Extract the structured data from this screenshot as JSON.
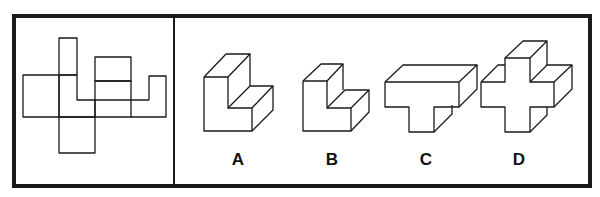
{
  "puzzle": {
    "net_panel": {
      "description": "unfolded net of a 3D shape"
    },
    "options": [
      {
        "label": "A",
        "shape": "L-shaped block (tall)"
      },
      {
        "label": "B",
        "shape": "L-shaped block (short)"
      },
      {
        "label": "C",
        "shape": "T-shaped block"
      },
      {
        "label": "D",
        "shape": "plus-shaped block"
      }
    ]
  }
}
